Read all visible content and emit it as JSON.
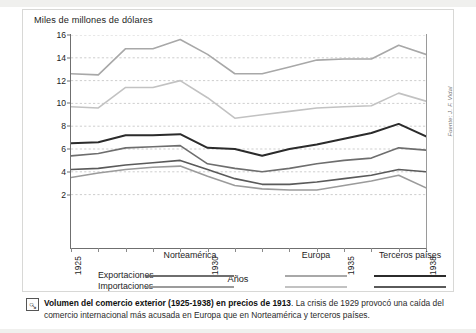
{
  "figure": {
    "y_axis_title": "Miles de millones de dólares",
    "x_axis_title": "Años",
    "source_note": "Fuente: J. F. Vidal"
  },
  "legend": {
    "groups": [
      "Norteamérica",
      "Europa",
      "Terceros países"
    ],
    "rows": [
      "Exportaciones",
      "Importaciones"
    ],
    "colors": {
      "norteamerica_exportaciones": "#6e6e6e",
      "norteamerica_importaciones": "#9b9b9b",
      "europa_exportaciones": "#a8a8a8",
      "europa_importaciones": "#c2c2c2",
      "terceros_exportaciones": "#2b2b2b",
      "terceros_importaciones": "#5a5a5a"
    }
  },
  "caption": {
    "title": "Volumen del comercio exterior (1925-1938) en precios de 1913",
    "body": ". La crisis de 1929 provocó una caída del comercio internacional más acusada en Europa que en Norteamérica y terceros países.",
    "icon": "magnifier-icon"
  },
  "chart_data": {
    "type": "line",
    "title": "Volumen del comercio exterior (1925-1938) en precios de 1913",
    "xlabel": "Años",
    "ylabel": "Miles de millones de dólares",
    "xlim": [
      1925,
      1938
    ],
    "ylim": [
      0,
      16
    ],
    "yticks": [
      2,
      4,
      6,
      8,
      10,
      12,
      14,
      16
    ],
    "xticks": [
      1925,
      1926,
      1927,
      1928,
      1929,
      1930,
      1931,
      1932,
      1933,
      1934,
      1935,
      1936,
      1937,
      1938
    ],
    "xtick_labels_shown": [
      "1925",
      "1930",
      "1935",
      "1938"
    ],
    "grid": "horizontal-dashed",
    "legend_position": "below",
    "x": [
      1925,
      1926,
      1927,
      1928,
      1929,
      1930,
      1931,
      1932,
      1933,
      1934,
      1935,
      1936,
      1937,
      1938
    ],
    "series": [
      {
        "name": "Europa — Exportaciones",
        "region": "Europa",
        "flow": "Exportaciones",
        "color": "#a8a8a8",
        "values": [
          12.6,
          12.5,
          14.8,
          14.8,
          15.6,
          14.3,
          12.6,
          12.6,
          13.2,
          13.8,
          13.9,
          13.9,
          15.1,
          14.3
        ]
      },
      {
        "name": "Europa — Importaciones",
        "region": "Europa",
        "flow": "Importaciones",
        "color": "#c2c2c2",
        "values": [
          9.7,
          9.6,
          11.4,
          11.4,
          12.0,
          10.5,
          8.7,
          9.0,
          9.3,
          9.6,
          9.7,
          9.8,
          10.9,
          10.2
        ]
      },
      {
        "name": "Terceros países — Exportaciones",
        "region": "Terceros países",
        "flow": "Exportaciones",
        "color": "#2b2b2b",
        "values": [
          6.5,
          6.6,
          7.2,
          7.2,
          7.3,
          6.1,
          6.0,
          5.4,
          6.0,
          6.4,
          6.9,
          7.4,
          8.2,
          7.1
        ]
      },
      {
        "name": "Norteamérica — Exportaciones",
        "region": "Norteamérica",
        "flow": "Exportaciones",
        "color": "#6e6e6e",
        "values": [
          5.4,
          5.6,
          6.1,
          6.2,
          6.3,
          4.7,
          4.3,
          4.0,
          4.3,
          4.7,
          5.0,
          5.2,
          6.1,
          5.9
        ]
      },
      {
        "name": "Terceros países — Importaciones",
        "region": "Terceros países",
        "flow": "Importaciones",
        "color": "#5a5a5a",
        "values": [
          4.2,
          4.3,
          4.6,
          4.8,
          5.0,
          4.2,
          3.4,
          2.9,
          2.9,
          3.1,
          3.4,
          3.7,
          4.2,
          4.0
        ]
      },
      {
        "name": "Norteamérica — Importaciones",
        "region": "Norteamérica",
        "flow": "Importaciones",
        "color": "#9b9b9b",
        "values": [
          3.5,
          3.9,
          4.2,
          4.4,
          4.5,
          3.6,
          2.8,
          2.5,
          2.4,
          2.4,
          2.8,
          3.2,
          3.7,
          2.6
        ]
      }
    ]
  }
}
